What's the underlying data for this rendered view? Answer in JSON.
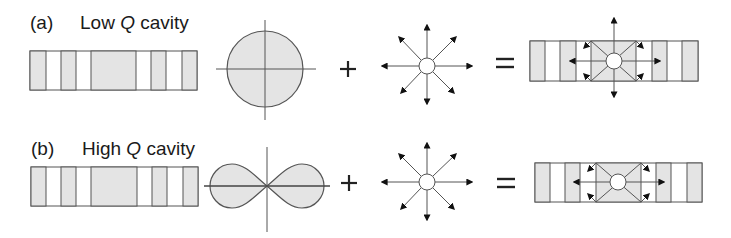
{
  "colors": {
    "fill": "#e4e4e4",
    "stroke": "#555555",
    "arrow": "#111111",
    "background": "#ffffff"
  },
  "rows": [
    {
      "id": "a",
      "tag": "(a)",
      "title_pre": "Low ",
      "title_q": "Q",
      "title_post": " cavity",
      "emission_pattern": "isotropic-circle",
      "operator_plus": "+",
      "operator_equals": "=",
      "result_arrows": [
        "up",
        "down",
        "left",
        "right",
        "up-left",
        "up-right",
        "down-left",
        "down-right"
      ]
    },
    {
      "id": "b",
      "tag": "(b)",
      "title_pre": "High ",
      "title_q": "Q",
      "title_post": " cavity",
      "emission_pattern": "figure-eight-lobes",
      "operator_plus": "+",
      "operator_equals": "=",
      "result_arrows": [
        "left",
        "right",
        "up-left",
        "up-right",
        "down-left",
        "down-right"
      ]
    }
  ],
  "cavity_segments": [
    "gray",
    "white",
    "gray",
    "white",
    "gray-wide",
    "white",
    "gray",
    "white",
    "gray"
  ],
  "dipole_icon": "radiating-point-source-8-arrows"
}
